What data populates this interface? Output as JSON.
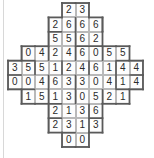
{
  "puzzle": {
    "title": "Domino grid puzzle",
    "type": "domino-fill-grid",
    "columns": 10,
    "rows": 10,
    "geometry": {
      "origin_x": 8,
      "origin_y": 3,
      "cell_width": 13.5,
      "cell_height": 14.4
    },
    "colors": {
      "cell_fill": "#fdfdfd",
      "cell_border": "#b9b9b9",
      "outline": "#5a5a5a",
      "digit": "#2b2b2b",
      "page_background": "#ffffff",
      "page_edge_line": "#d8d8d8"
    },
    "grid_rows": [
      {
        "row": 0,
        "start_col": 4,
        "values": [
          2,
          3
        ]
      },
      {
        "row": 1,
        "start_col": 3,
        "values": [
          2,
          6,
          6,
          6
        ]
      },
      {
        "row": 2,
        "start_col": 3,
        "values": [
          5,
          5,
          6,
          2
        ]
      },
      {
        "row": 3,
        "start_col": 1,
        "values": [
          0,
          4,
          2,
          4,
          6,
          0,
          5,
          5
        ]
      },
      {
        "row": 4,
        "start_col": 0,
        "values": [
          3,
          5,
          5,
          1,
          2,
          4,
          6,
          1,
          4,
          4
        ]
      },
      {
        "row": 5,
        "start_col": 0,
        "values": [
          0,
          0,
          4,
          6,
          3,
          3,
          0,
          4,
          1,
          4
        ]
      },
      {
        "row": 6,
        "start_col": 1,
        "values": [
          1,
          5,
          1,
          3,
          0,
          5,
          2,
          1
        ]
      },
      {
        "row": 7,
        "start_col": 3,
        "values": [
          2,
          1,
          3,
          6
        ]
      },
      {
        "row": 8,
        "start_col": 3,
        "values": [
          2,
          3,
          1,
          3
        ]
      },
      {
        "row": 9,
        "start_col": 4,
        "values": [
          0,
          0
        ]
      }
    ],
    "domino_dividers_horizontal": [
      {
        "row": 1,
        "col": 4
      },
      {
        "row": 1,
        "col": 6
      },
      {
        "row": 2,
        "col": 4
      },
      {
        "row": 3,
        "col": 2
      },
      {
        "row": 3,
        "col": 4
      },
      {
        "row": 3,
        "col": 6
      },
      {
        "row": 4,
        "col": 1
      },
      {
        "row": 4,
        "col": 3
      },
      {
        "row": 4,
        "col": 5
      },
      {
        "row": 4,
        "col": 7
      },
      {
        "row": 5,
        "col": 2
      },
      {
        "row": 5,
        "col": 4
      },
      {
        "row": 5,
        "col": 7
      },
      {
        "row": 6,
        "col": 2
      },
      {
        "row": 6,
        "col": 4
      },
      {
        "row": 6,
        "col": 6
      },
      {
        "row": 7,
        "col": 5
      },
      {
        "row": 8,
        "col": 5
      }
    ],
    "domino_dividers_vertical": [
      {
        "row": 1,
        "col": 3
      },
      {
        "row": 2,
        "col": 5
      },
      {
        "row": 2,
        "col": 6
      },
      {
        "row": 3,
        "col": 1
      },
      {
        "row": 3,
        "col": 8
      },
      {
        "row": 4,
        "col": 0
      },
      {
        "row": 4,
        "col": 9
      },
      {
        "row": 5,
        "col": 1
      },
      {
        "row": 5,
        "col": 8
      },
      {
        "row": 6,
        "col": 3
      },
      {
        "row": 7,
        "col": 3
      },
      {
        "row": 7,
        "col": 6
      },
      {
        "row": 8,
        "col": 4
      }
    ]
  }
}
